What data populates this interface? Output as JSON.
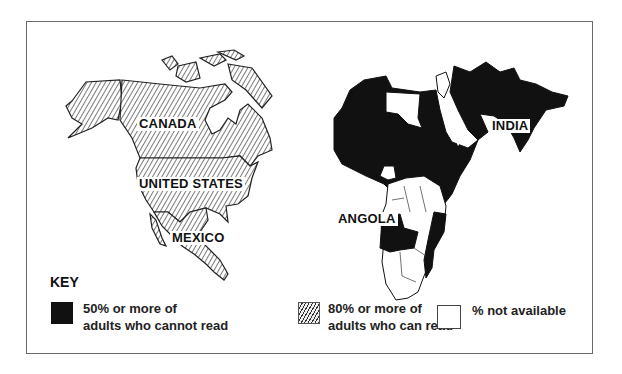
{
  "map": {
    "type": "choropleth",
    "regions": [
      {
        "name": "CANADA",
        "category": "literate_80_plus"
      },
      {
        "name": "UNITED STATES",
        "category": "literate_80_plus"
      },
      {
        "name": "MEXICO",
        "category": "literate_80_plus"
      },
      {
        "name": "INDIA",
        "category": "illiterate_50_plus"
      },
      {
        "name": "ANGOLA",
        "category": "illiterate_50_plus"
      }
    ],
    "labels": {
      "canada": "CANADA",
      "united_states": "UNITED STATES",
      "mexico": "MEXICO",
      "india": "INDIA",
      "angola": "ANGOLA"
    }
  },
  "key": {
    "title": "KEY",
    "items": [
      {
        "pattern": "solid-black",
        "line1": "50% or more of",
        "line2": "adults who cannot read",
        "color": "#111111"
      },
      {
        "pattern": "diagonal-hatch",
        "line1": "80% or more of",
        "line2": "adults who can read",
        "color": "#333333"
      },
      {
        "pattern": "white",
        "line1": "% not available",
        "line2": "",
        "color": "#ffffff"
      }
    ]
  },
  "colors": {
    "illiterate": "#111111",
    "hatch": "#333333",
    "background": "#ffffff",
    "frame": "#6a6a6a"
  }
}
